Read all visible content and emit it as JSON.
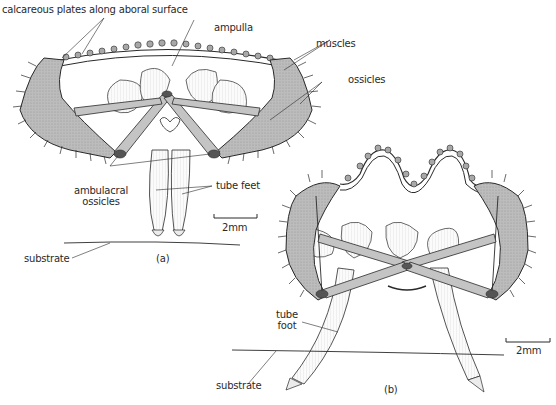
{
  "figure": {
    "panels": [
      {
        "id": "a",
        "caption": "(a)",
        "labels": {
          "calcareous_plates": "calcareous plates along aboral surface",
          "ampulla": "ampulla",
          "muscles": "muscles",
          "ossicles": "ossicles",
          "ambulacral_ossicles_line1": "ambulacral",
          "ambulacral_ossicles_line2": "ossicles",
          "tube_feet": "tube feet",
          "substrate": "substrate",
          "scale_bar": "2mm"
        }
      },
      {
        "id": "b",
        "caption": "(b)",
        "labels": {
          "tube_foot_line1": "tube",
          "tube_foot_line2": "foot",
          "substrate": "substrate",
          "scale_bar": "2mm"
        }
      }
    ],
    "colors": {
      "ink": "#2a2a2a",
      "shading": "#b8b8b8",
      "light_fill": "#f3f3f3",
      "background": "#ffffff"
    }
  }
}
